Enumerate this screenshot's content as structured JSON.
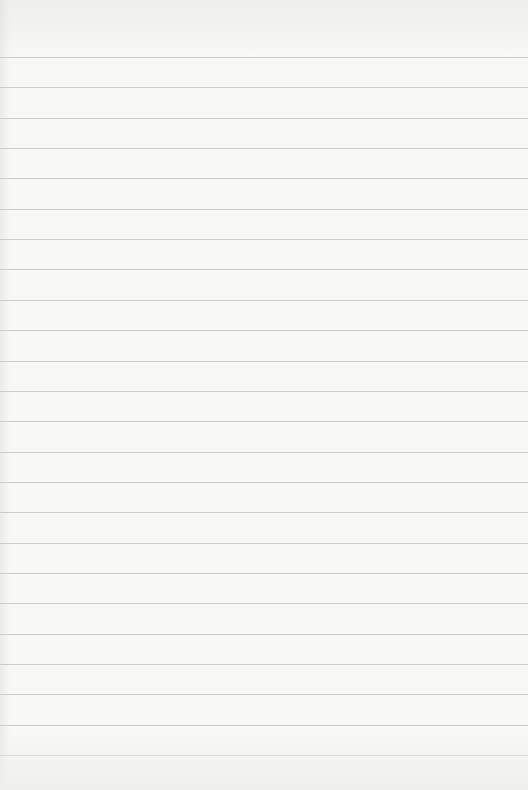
{
  "page": {
    "type": "lined-paper",
    "width": 528,
    "height": 790,
    "background_color": "#f8f8f7",
    "rule_color": "#cdcdcc",
    "first_rule_y": 57,
    "rule_spacing": 30.35,
    "rule_count": 24
  }
}
